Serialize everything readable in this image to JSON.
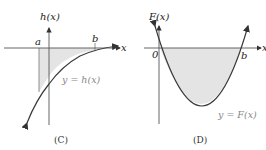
{
  "panels": [
    {
      "caption": "(C)",
      "y_axis_label": "h(x)",
      "x_axis_label": "x",
      "point_a": "a",
      "point_b": "b",
      "curve_label": "y = h(x)"
    },
    {
      "caption": "(D)",
      "y_axis_label": "F(x)",
      "x_axis_label": "x",
      "origin_label": "0",
      "point_b": "b",
      "curve_label": "y = F(x)"
    }
  ],
  "colors": {
    "axis": "#555555",
    "curve": "#3a3a3a",
    "shade": "#e4e4e4",
    "accent_arrow": "#333333"
  }
}
